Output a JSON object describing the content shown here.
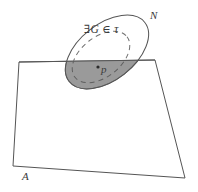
{
  "figure": {
    "caption_labels": {
      "plane_label": "A",
      "neighborhood_label": "N",
      "open_set_label": "∃G ∈ τ",
      "point_label": "p"
    },
    "colors": {
      "stroke": "#555555",
      "shaded_fill": "#9a9a9a",
      "shaded_stroke": "#6e6e6e",
      "dashed_stroke": "#707070",
      "background": "#ffffff",
      "text": "#3a3a3a"
    },
    "geometry": {
      "plane_quad_points": "19,62 155,60 185,178 13,166",
      "ellipse_N": {
        "cx": 107,
        "cy": 52,
        "rx": 48,
        "ry": 28,
        "rotation_deg": -38
      },
      "ellipse_G": {
        "cx": 101,
        "cy": 57,
        "rx": 33,
        "ry": 20,
        "rotation_deg": -38
      },
      "point_p": {
        "cx": 98,
        "cy": 67,
        "r": 1.6
      },
      "plane_top_edge_y": 61
    }
  }
}
